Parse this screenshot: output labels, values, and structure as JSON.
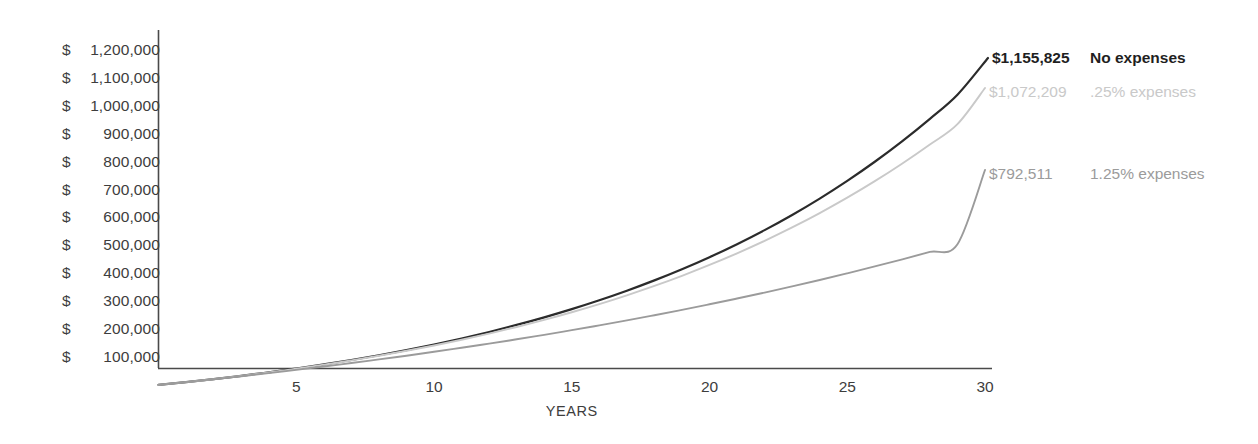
{
  "chart_data": {
    "type": "line",
    "title": "",
    "xlabel": "YEARS",
    "ylabel": "",
    "xlim": [
      0,
      30
    ],
    "ylim": [
      0,
      1200000
    ],
    "grid": false,
    "legend_position": "right-inline",
    "x_ticks": [
      "5",
      "10",
      "15",
      "20",
      "25",
      "30"
    ],
    "x_tick_values": [
      5,
      10,
      15,
      20,
      25,
      30
    ],
    "y_ticks": [
      "$ 1,200,000",
      "$ 1,100,000",
      "$ 1,000,000",
      "$  900,000",
      "$  800,000",
      "$  700,000",
      "$  600,000",
      "$  500,000",
      "$  400,000",
      "$  300,000",
      "$  200,000",
      "$  100,000"
    ],
    "y_tick_values": [
      1200000,
      1100000,
      1000000,
      900000,
      800000,
      700000,
      600000,
      500000,
      400000,
      300000,
      200000,
      100000
    ],
    "y_tick_currency": "$",
    "y_tick_numbers": [
      "1,200,000",
      "1,100,000",
      "1,000,000",
      "900,000",
      "800,000",
      "700,000",
      "600,000",
      "500,000",
      "400,000",
      "300,000",
      "200,000",
      "100,000"
    ],
    "x": [
      0,
      1,
      2,
      3,
      4,
      5,
      6,
      7,
      8,
      9,
      10,
      11,
      12,
      13,
      14,
      15,
      16,
      17,
      18,
      19,
      20,
      21,
      22,
      23,
      24,
      25,
      26,
      27,
      28,
      29,
      30
    ],
    "series": [
      {
        "name": "No expenses",
        "color": "#2b2b2b",
        "end_value": 1155825,
        "end_label": "$1,155,825",
        "legend_label": "No expenses",
        "values": [
          0,
          10000,
          20800,
          32464,
          45061,
          58666,
          73359,
          89228,
          106366,
          124876,
          144865,
          166454,
          189770,
          214952,
          242148,
          271520,
          303242,
          337501,
          374501,
          414461,
          457618,
          504228,
          554566,
          608932,
          667646,
          731058,
          799543,
          873506,
          953387,
          1039658,
          1155825
        ]
      },
      {
        "name": ".25% expenses",
        "color": "#c9c9c9",
        "end_value": 1072209,
        "end_label": "$1,072,209",
        "legend_label": ".25% expenses",
        "values": [
          0,
          10000,
          20750,
          32306,
          44729,
          58083,
          72435,
          87858,
          104430,
          122233,
          141357,
          161896,
          183953,
          207636,
          233063,
          260358,
          289655,
          321097,
          354838,
          391042,
          429887,
          471561,
          516268,
          564224,
          615661,
          670830,
          729995,
          793443,
          861479,
          934432,
          1072209
        ]
      },
      {
        "name": "1.25% expenses",
        "color": "#9b9b9b",
        "end_value": 792511,
        "end_label": "$792,511",
        "legend_label": "1.25% expenses",
        "values": [
          0,
          10000,
          20375,
          31139,
          42305,
          53888,
          65902,
          78362,
          91284,
          104685,
          118580,
          132988,
          147925,
          163412,
          179466,
          196108,
          213359,
          231240,
          249773,
          268982,
          288891,
          309524,
          330909,
          353071,
          376040,
          399844,
          424514,
          450081,
          476579,
          504041,
          792511
        ]
      }
    ]
  },
  "axis": {
    "x_axis_name": "x-axis",
    "y_axis_name": "y-axis"
  }
}
